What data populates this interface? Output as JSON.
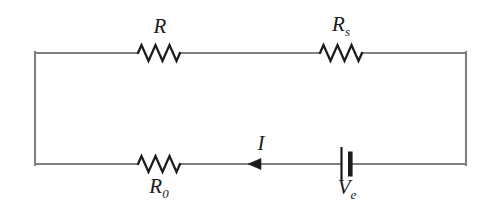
{
  "figure": {
    "kind": "electrical-circuit-schematic",
    "background_color": "#ffffff",
    "wire_color": "#808080",
    "component_color": "#1b1b1b",
    "width": 493,
    "height": 212
  },
  "loop": {
    "left_x": 35,
    "right_x": 466,
    "top_y": 53,
    "bottom_y": 164
  },
  "components": {
    "resistor_top_left": {
      "label_base": "R",
      "label_sub": "",
      "label_position": "above",
      "branch": "top"
    },
    "resistor_top_right": {
      "label_base": "R",
      "label_sub": "s",
      "label_position": "above",
      "branch": "top"
    },
    "resistor_bottom_left": {
      "label_base": "R",
      "label_sub": "0",
      "label_position": "below",
      "branch": "bottom"
    },
    "battery": {
      "label_base": "V",
      "label_sub": "e",
      "label_position": "below",
      "branch": "bottom"
    },
    "current": {
      "label_base": "I",
      "label_sub": "",
      "label_position": "above",
      "direction": "left",
      "branch": "bottom"
    }
  }
}
